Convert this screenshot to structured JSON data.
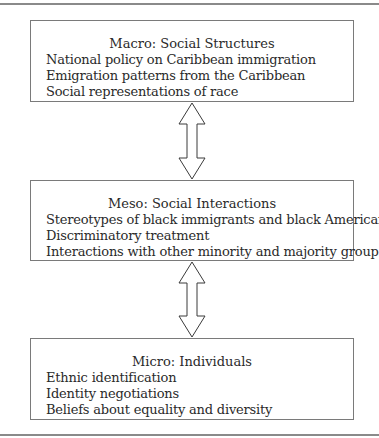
{
  "diagram": {
    "levels": [
      {
        "title": "Macro: Social Structures",
        "items": [
          "National policy on Caribbean immigration",
          "Emigration patterns from the Caribbean",
          "Social representations of race"
        ]
      },
      {
        "title": "Meso: Social Interactions",
        "items": [
          "Stereotypes of black immigrants and black Americans",
          "Discriminatory treatment",
          "Interactions with other minority and majority groups"
        ]
      },
      {
        "title": "Micro: Individuals",
        "items": [
          "Ethnic identification",
          "Identity negotiations",
          "Beliefs about equality and diversity"
        ]
      }
    ],
    "connectors": [
      {
        "from": "Macro: Social Structures",
        "to": "Meso: Social Interactions",
        "type": "bidirectional-arrow"
      },
      {
        "from": "Meso: Social Interactions",
        "to": "Micro: Individuals",
        "type": "bidirectional-arrow"
      }
    ],
    "colors": {
      "line": "#7a7a7a",
      "text": "#2a2a2a",
      "background": "#ffffff"
    }
  }
}
